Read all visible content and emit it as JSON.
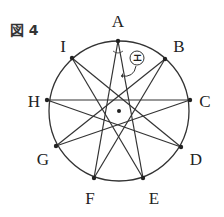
{
  "figure": {
    "title": "図 4",
    "circle": {
      "cx": 119,
      "cy": 111,
      "r": 70
    },
    "center_dot": {
      "x": 119,
      "y": 111
    },
    "points": [
      {
        "name": "A",
        "x": 118,
        "y": 41,
        "lx": 118,
        "ly": 21
      },
      {
        "name": "B",
        "x": 165,
        "y": 59,
        "lx": 179,
        "ly": 46
      },
      {
        "name": "C",
        "x": 190,
        "y": 100,
        "lx": 205,
        "ly": 101
      },
      {
        "name": "D",
        "x": 181,
        "y": 147,
        "lx": 196,
        "ly": 159
      },
      {
        "name": "E",
        "x": 143,
        "y": 178,
        "lx": 154,
        "ly": 198
      },
      {
        "name": "F",
        "x": 94,
        "y": 178,
        "lx": 90,
        "ly": 198
      },
      {
        "name": "G",
        "x": 56,
        "y": 146,
        "lx": 43,
        "ly": 159
      },
      {
        "name": "H",
        "x": 47,
        "y": 100,
        "lx": 34,
        "ly": 101
      },
      {
        "name": "I",
        "x": 72,
        "y": 58,
        "lx": 63,
        "ly": 46
      }
    ],
    "star_step": 4,
    "angle_mark": {
      "label": "エ",
      "cx": 137,
      "cy": 58,
      "r": 7
    }
  }
}
